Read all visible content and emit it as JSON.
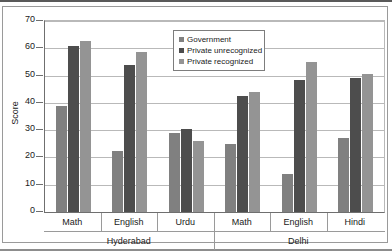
{
  "chart_data": {
    "type": "bar",
    "title": "",
    "xlabel": "",
    "ylabel": "Score",
    "ylim": [
      0,
      70
    ],
    "yticks": [
      0,
      10,
      20,
      30,
      40,
      50,
      60,
      70
    ],
    "grid": true,
    "legend_position": "top-center",
    "categories": [
      "Math",
      "English",
      "Urdu",
      "Math",
      "English",
      "Hindi"
    ],
    "groups": [
      {
        "label": "Hyderabad",
        "categories": [
          "Math",
          "English",
          "Urdu"
        ]
      },
      {
        "label": "Delhi",
        "categories": [
          "Math",
          "English",
          "Hindi"
        ]
      }
    ],
    "series": [
      {
        "name": "Government",
        "color": "#808080",
        "values": [
          39,
          22.5,
          29,
          25,
          14,
          27
        ]
      },
      {
        "name": "Private unrecognized",
        "color": "#4d4d4d",
        "values": [
          61,
          54,
          30.5,
          42.5,
          48.5,
          49
        ]
      },
      {
        "name": "Private recognized",
        "color": "#949494",
        "values": [
          62.5,
          58.5,
          26,
          44,
          55,
          50.5
        ]
      }
    ]
  }
}
